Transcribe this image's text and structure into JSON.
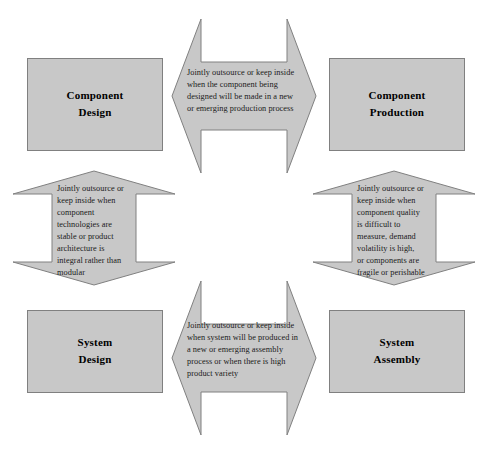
{
  "diagram": {
    "fill_color": "#c8c8c8",
    "stroke_color": "#808080",
    "text_color": "#000000",
    "background": "#ffffff",
    "nodes": [
      {
        "id": "component-design",
        "line1": "Component",
        "line2": "Design"
      },
      {
        "id": "component-production",
        "line1": "Component",
        "line2": "Production"
      },
      {
        "id": "system-design",
        "line1": "System",
        "line2": "Design"
      },
      {
        "id": "system-assembly",
        "line1": "System",
        "line2": "Assembly"
      }
    ],
    "arrows": [
      {
        "id": "top-arrow",
        "orientation": "horizontal",
        "connects": [
          "component-design",
          "component-production"
        ],
        "text": "Jointly outsource or keep inside\nwhen the component being\ndesigned will be made in a new\nor emerging production process"
      },
      {
        "id": "left-arrow",
        "orientation": "vertical",
        "connects": [
          "component-design",
          "system-design"
        ],
        "text": "Jointly outsource or\nkeep inside when\ncomponent\ntechnologies are\nstable or product\narchitecture is\nintegral rather than\nmodular"
      },
      {
        "id": "right-arrow",
        "orientation": "vertical",
        "connects": [
          "component-production",
          "system-assembly"
        ],
        "text": "Jointly outsource or\nkeep inside when\ncomponent quality\nis difficult to\nmeasure, demand\nvolatility is high,\nor components are\nfragile or perishable"
      },
      {
        "id": "bottom-arrow",
        "orientation": "horizontal",
        "connects": [
          "system-design",
          "system-assembly"
        ],
        "text": "Jointly outsource or keep inside\nwhen system will be produced in\na new or emerging assembly\nprocess or when there is high\nproduct variety"
      }
    ]
  }
}
